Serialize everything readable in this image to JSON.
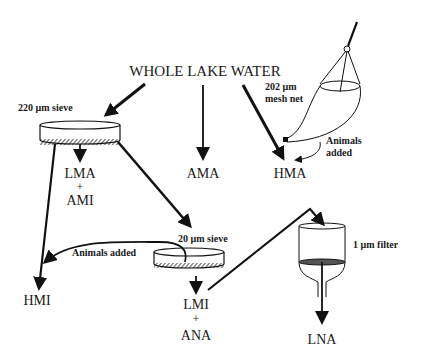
{
  "diagram": {
    "title": "WHOLE LAKE WATER",
    "equipment": {
      "sieve_220": "220 µm sieve",
      "sieve_20": "20 µm sieve",
      "net_line1": "202 µm",
      "net_line2": "mesh net",
      "filter_1": "1 µm filter"
    },
    "annotations": {
      "animals_added_net_line1": "Animals",
      "animals_added_net_line2": "added",
      "animals_added_sieve": "Animals added"
    },
    "outputs": {
      "lma": "LMA",
      "plus1": "+",
      "ami": "AMI",
      "ama": "AMA",
      "hma": "HMA",
      "hmi": "HMI",
      "lmi": "LMI",
      "plus2": "+",
      "ana": "ANA",
      "lna": "LNA"
    },
    "colors": {
      "ink": "#111111",
      "background": "#ffffff",
      "filter_disk": "#555555"
    }
  }
}
